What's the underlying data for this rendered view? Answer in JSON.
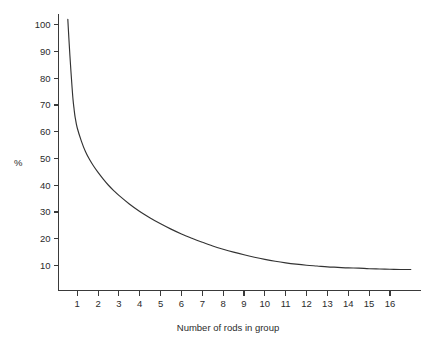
{
  "chart_data": {
    "type": "line",
    "title": "",
    "xlabel": "Number of rods in group",
    "ylabel": "%",
    "xlim": [
      0,
      17
    ],
    "ylim": [
      0,
      105
    ],
    "grid": false,
    "legend": null,
    "x_ticks": [
      1,
      2,
      3,
      4,
      5,
      6,
      7,
      8,
      9,
      10,
      11,
      12,
      13,
      14,
      15,
      16
    ],
    "y_ticks": [
      10,
      20,
      30,
      40,
      50,
      60,
      70,
      80,
      90,
      100
    ],
    "series": [
      {
        "name": "percentage",
        "color": "#333333",
        "x": [
          0.55,
          0.6,
          0.65,
          0.7,
          0.75,
          0.8,
          0.85,
          0.9,
          1.0,
          1.2,
          1.4,
          1.6,
          1.8,
          2.0,
          2.25,
          2.5,
          2.75,
          3.0,
          3.5,
          4.0,
          4.5,
          5.0,
          5.5,
          6.0,
          6.5,
          7.0,
          7.5,
          8.0,
          8.5,
          9.0,
          9.5,
          10.0,
          10.5,
          11.0,
          11.5,
          12.0,
          12.5,
          13.0,
          13.5,
          14.0,
          14.5,
          15.0,
          15.5,
          16.0,
          16.5,
          17.0
        ],
        "y": [
          102.0,
          95.0,
          88.5,
          82.5,
          77.0,
          72.0,
          68.5,
          65.5,
          61.5,
          56.5,
          52.5,
          49.5,
          47.0,
          44.8,
          42.3,
          40.0,
          38.0,
          36.2,
          33.0,
          30.2,
          27.8,
          25.6,
          23.6,
          21.8,
          20.2,
          18.7,
          17.3,
          16.1,
          15.0,
          14.0,
          13.1,
          12.3,
          11.6,
          11.0,
          10.5,
          10.1,
          9.8,
          9.5,
          9.3,
          9.1,
          9.0,
          8.8,
          8.7,
          8.6,
          8.5,
          8.5
        ]
      }
    ]
  },
  "axis": {
    "x_title": "Number of rods in group",
    "y_title": "%"
  }
}
